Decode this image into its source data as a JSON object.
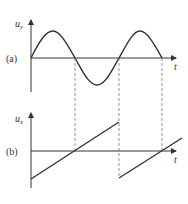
{
  "diagram": {
    "panel_a": {
      "label": "(a)",
      "y_axis_label": "u",
      "y_axis_subscript": "y",
      "x_axis_label": "t",
      "waveform": "sine"
    },
    "panel_b": {
      "label": "(b)",
      "y_axis_label": "u",
      "y_axis_subscript": "x",
      "x_axis_label": "t",
      "waveform": "sawtooth"
    },
    "guides": "dashed vertical lines at zero crossings of sine wave"
  },
  "colors": {
    "stroke": "#333333",
    "dashed": "#777777",
    "background": "#ffffff"
  }
}
